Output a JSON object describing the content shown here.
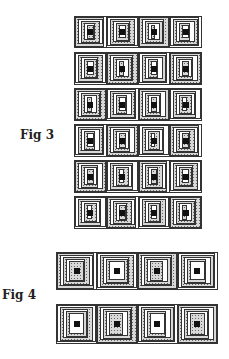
{
  "figures": [
    {
      "label": "Fig 3",
      "rows": 6,
      "blocks_per_row": 4,
      "description": "Log cabin quilt block strips, alternating speckled (dark) and plain (light) logs"
    },
    {
      "label": "Fig 4",
      "rows": 2,
      "blocks_per_row": 4,
      "description": "Log cabin quilt block strips, wider blocks with offset joins"
    }
  ],
  "colors": {
    "line": "#333333",
    "speckle": "#d8d8d8",
    "center": "#111111",
    "background": "#ffffff"
  }
}
